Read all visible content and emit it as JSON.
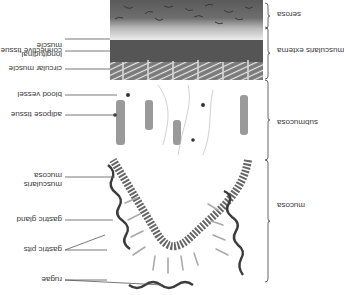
{
  "orientation": "upside-down",
  "layers": [
    {
      "name": "serosa",
      "label": "serosa"
    },
    {
      "name": "muscularis-externa",
      "label": "muscularis externa"
    },
    {
      "name": "submucosa",
      "label": "submucosa"
    },
    {
      "name": "mucosa",
      "label": "mucosa"
    }
  ],
  "structures": [
    {
      "name": "longitudinal-muscle",
      "label_line1": "longitudinal",
      "label_line2": "muscle"
    },
    {
      "name": "connective-tissue",
      "label": "connective tissue"
    },
    {
      "name": "circular-muscle",
      "label": "circular muscle"
    },
    {
      "name": "blood-vessel",
      "label": "blood vessel"
    },
    {
      "name": "adipose-tissue",
      "label": "adipose tissue"
    },
    {
      "name": "muscularis-mucosa",
      "label_line1": "muscularis",
      "label_line2": "mucosa"
    },
    {
      "name": "gastric-gland",
      "label": "gastric gland"
    },
    {
      "name": "gastric-pits",
      "label": "gastric pits"
    },
    {
      "name": "rugae",
      "label": "rugae"
    }
  ],
  "colors": {
    "background": "#ffffff",
    "text": "#3a3a3a",
    "leader_line": "#555555",
    "muscle_dark": "#4a4a4a",
    "muscle_mid": "#8a8a8a",
    "serosa_light": "#d8d8d8",
    "outline": "#3c3c3c",
    "gland": "#b0b0b0"
  }
}
